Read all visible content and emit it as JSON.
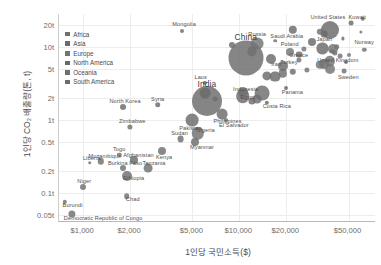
{
  "chart_data": {
    "type": "scatter",
    "title": "",
    "xlabel": "1인당 국민소득($)",
    "ylabel": "1인당 CO₂ 배출량(톤, t)",
    "xscale": "log",
    "yscale": "log",
    "xlim": [
      700,
      75000
    ],
    "ylim": [
      0.04,
      28
    ],
    "grid": true,
    "legend_position": "top-left",
    "size_encodes": "population",
    "xticks": [
      "$1,000",
      "$2,000",
      "$5,000",
      "$10,000",
      "$20,000",
      "$50,000"
    ],
    "xtick_values": [
      1000,
      2000,
      5000,
      10000,
      20000,
      50000
    ],
    "yticks": [
      "20t",
      "10t",
      "5t",
      "2t",
      "1t",
      "0.5t",
      "0.2t",
      "0.1t",
      "0.05t"
    ],
    "ytick_values": [
      20,
      10,
      5,
      2,
      1,
      0.5,
      0.2,
      0.1,
      0.05
    ],
    "legend": [
      {
        "label": "Africa",
        "color": "#6f6f6f"
      },
      {
        "label": "Asia",
        "color": "#6a6a6a"
      },
      {
        "label": "Europe",
        "color": "#737373"
      },
      {
        "label": "North America",
        "color": "#696969"
      },
      {
        "label": "Oceania",
        "color": "#707070"
      },
      {
        "label": "South America",
        "color": "#6d6d6d"
      }
    ],
    "points": [
      {
        "name": "Qatar",
        "x": 62000,
        "y": 24.0,
        "r": 2.2,
        "g": "Asia",
        "label": false
      },
      {
        "name": "Kuwait",
        "x": 52000,
        "y": 21.0,
        "r": 2.4,
        "g": "Asia",
        "label": true,
        "lx": 6,
        "ly": -6
      },
      {
        "name": "United States",
        "x": 38000,
        "y": 17.0,
        "r": 9.0,
        "g": "North America",
        "label": true,
        "lx": -2,
        "ly": -13
      },
      {
        "name": "Mongolia",
        "x": 4300,
        "y": 16.5,
        "r": 2.0,
        "g": "Asia",
        "label": true,
        "lx": 2,
        "ly": -7
      },
      {
        "name": "Australia",
        "x": 33000,
        "y": 16.0,
        "r": 3.2,
        "g": "Oceania",
        "label": false
      },
      {
        "name": "Canada",
        "x": 35000,
        "y": 15.0,
        "r": 3.4,
        "g": "North America",
        "label": false
      },
      {
        "name": "Luxembourg",
        "x": 60000,
        "y": 16.0,
        "r": 1.6,
        "g": "Europe",
        "label": false
      },
      {
        "name": "Brunei",
        "x": 46000,
        "y": 13.0,
        "r": 1.6,
        "g": "Asia",
        "label": false
      },
      {
        "name": "Estonia",
        "x": 17000,
        "y": 12.0,
        "r": 1.8,
        "g": "Europe",
        "label": false
      },
      {
        "name": "Russia",
        "x": 13000,
        "y": 11.0,
        "r": 6.4,
        "g": "Europe",
        "label": true,
        "lx": 0,
        "ly": -10
      },
      {
        "name": "Kazakhstan",
        "x": 9000,
        "y": 10.5,
        "r": 3.0,
        "g": "Asia",
        "label": false
      },
      {
        "name": "Norway",
        "x": 63000,
        "y": 9.0,
        "r": 2.2,
        "g": "Europe",
        "label": true,
        "lx": 0,
        "ly": -8
      },
      {
        "name": "Netherlands",
        "x": 42000,
        "y": 10.0,
        "r": 2.8,
        "g": "Europe",
        "label": false
      },
      {
        "name": "Japan",
        "x": 34000,
        "y": 9.5,
        "r": 5.6,
        "g": "Asia",
        "label": true,
        "lx": 2,
        "ly": -9
      },
      {
        "name": "Germany",
        "x": 40000,
        "y": 9.2,
        "r": 5.0,
        "g": "Europe",
        "label": false
      },
      {
        "name": "Poland",
        "x": 21000,
        "y": 8.5,
        "r": 4.0,
        "g": "Europe",
        "label": true,
        "lx": 0,
        "ly": -8
      },
      {
        "name": "South Korea",
        "x": 29000,
        "y": 11.5,
        "r": 4.0,
        "g": "Asia",
        "label": false
      },
      {
        "name": "Finland",
        "x": 39000,
        "y": 8.8,
        "r": 2.0,
        "g": "Europe",
        "label": false
      },
      {
        "name": "Czechia",
        "x": 26000,
        "y": 9.4,
        "r": 2.6,
        "g": "Europe",
        "label": false
      },
      {
        "name": "China",
        "x": 11000,
        "y": 7.0,
        "r": 17.5,
        "g": "Asia",
        "label": true,
        "lx": 0,
        "ly": -21,
        "big": true
      },
      {
        "name": "Belgium",
        "x": 41000,
        "y": 8.2,
        "r": 2.6,
        "g": "Europe",
        "label": false
      },
      {
        "name": "Austria",
        "x": 44000,
        "y": 7.4,
        "r": 2.4,
        "g": "Europe",
        "label": false
      },
      {
        "name": "Ireland",
        "x": 50000,
        "y": 7.6,
        "r": 2.0,
        "g": "Europe",
        "label": false
      },
      {
        "name": "Denmark",
        "x": 48000,
        "y": 6.2,
        "r": 2.0,
        "g": "Europe",
        "label": false
      },
      {
        "name": "United Kingdom",
        "x": 38000,
        "y": 6.3,
        "r": 5.2,
        "g": "Europe",
        "label": true,
        "lx": 8,
        "ly": -1
      },
      {
        "name": "Sweden",
        "x": 47000,
        "y": 4.6,
        "r": 2.4,
        "g": "Europe",
        "label": true,
        "lx": 4,
        "ly": 6
      },
      {
        "name": "Greece",
        "x": 24000,
        "y": 6.6,
        "r": 2.6,
        "g": "Europe",
        "label": true,
        "lx": 0,
        "ly": -5
      },
      {
        "name": "Saudi Arabia",
        "x": 22000,
        "y": 17.0,
        "r": 4.2,
        "g": "Asia",
        "label": true,
        "lx": -6,
        "ly": 6
      },
      {
        "name": "Iran",
        "x": 16000,
        "y": 6.8,
        "r": 5.0,
        "g": "Asia",
        "label": true,
        "lx": 5,
        "ly": 5
      },
      {
        "name": "Turkey",
        "x": 19000,
        "y": 5.4,
        "r": 5.0,
        "g": "Asia",
        "label": true,
        "lx": 6,
        "ly": -4
      },
      {
        "name": "Malaysia",
        "x": 24000,
        "y": 7.8,
        "r": 3.4,
        "g": "Asia",
        "label": false
      },
      {
        "name": "South Africa",
        "x": 12000,
        "y": 8.6,
        "r": 4.6,
        "g": "Africa",
        "label": false
      },
      {
        "name": "Spain",
        "x": 33000,
        "y": 5.6,
        "r": 4.2,
        "g": "Europe",
        "label": false
      },
      {
        "name": "Italy",
        "x": 35000,
        "y": 5.8,
        "r": 5.0,
        "g": "Europe",
        "label": false
      },
      {
        "name": "France",
        "x": 38000,
        "y": 5.0,
        "r": 5.0,
        "g": "Europe",
        "label": false
      },
      {
        "name": "Portugal",
        "x": 27000,
        "y": 4.8,
        "r": 2.6,
        "g": "Europe",
        "label": false
      },
      {
        "name": "Chile",
        "x": 22000,
        "y": 4.5,
        "r": 3.2,
        "g": "South America",
        "label": false
      },
      {
        "name": "Mexico",
        "x": 17000,
        "y": 3.9,
        "r": 5.4,
        "g": "North America",
        "label": false
      },
      {
        "name": "Argentina",
        "x": 19000,
        "y": 4.3,
        "r": 4.2,
        "g": "South America",
        "label": false
      },
      {
        "name": "Thailand",
        "x": 15000,
        "y": 4.0,
        "r": 4.6,
        "g": "Asia",
        "label": false
      },
      {
        "name": "Egypt",
        "x": 10500,
        "y": 2.4,
        "r": 5.0,
        "g": "Africa",
        "label": true,
        "lx": 5,
        "ly": 5
      },
      {
        "name": "Panama",
        "x": 20000,
        "y": 2.7,
        "r": 2.0,
        "g": "North America",
        "label": true,
        "lx": 6,
        "ly": 4
      },
      {
        "name": "Brazil",
        "x": 14000,
        "y": 2.3,
        "r": 7.4,
        "g": "South America",
        "label": false
      },
      {
        "name": "Indonesia",
        "x": 10500,
        "y": 2.1,
        "r": 6.8,
        "g": "Asia",
        "label": true,
        "lx": 3,
        "ly": -7
      },
      {
        "name": "Colombia",
        "x": 13000,
        "y": 1.9,
        "r": 4.4,
        "g": "South America",
        "label": false
      },
      {
        "name": "Costa Rica",
        "x": 15000,
        "y": 1.7,
        "r": 2.2,
        "g": "North America",
        "label": true,
        "lx": 10,
        "ly": 3
      },
      {
        "name": "Peru",
        "x": 12000,
        "y": 1.8,
        "r": 3.6,
        "g": "South America",
        "label": false
      },
      {
        "name": "Vietnam",
        "x": 6000,
        "y": 2.3,
        "r": 5.4,
        "g": "Asia",
        "label": false
      },
      {
        "name": "India",
        "x": 6200,
        "y": 1.8,
        "r": 15.0,
        "g": "Asia",
        "label": true,
        "lx": 0,
        "ly": -17,
        "big": true
      },
      {
        "name": "Philippines",
        "x": 7800,
        "y": 1.2,
        "r": 5.4,
        "g": "Asia",
        "label": true,
        "lx": 5,
        "ly": 7
      },
      {
        "name": "Bolivia",
        "x": 7000,
        "y": 1.9,
        "r": 2.4,
        "g": "South America",
        "label": false
      },
      {
        "name": "El Salvador",
        "x": 8200,
        "y": 1.0,
        "r": 2.0,
        "g": "North America",
        "label": true,
        "lx": 8,
        "ly": 5
      },
      {
        "name": "Syria",
        "x": 3000,
        "y": 1.6,
        "r": 2.8,
        "g": "Asia",
        "label": true,
        "lx": 0,
        "ly": -6
      },
      {
        "name": "Pakistan",
        "x": 5000,
        "y": 1.0,
        "r": 6.4,
        "g": "Asia",
        "label": true,
        "lx": -2,
        "ly": 8
      },
      {
        "name": "Nigeria",
        "x": 5400,
        "y": 0.65,
        "r": 6.2,
        "g": "Africa",
        "label": true,
        "lx": 8,
        "ly": -3
      },
      {
        "name": "North Korea",
        "x": 1800,
        "y": 1.5,
        "r": 3.0,
        "g": "Asia",
        "label": true,
        "lx": 2,
        "ly": -6
      },
      {
        "name": "Myanmar",
        "x": 5200,
        "y": 0.5,
        "r": 4.0,
        "g": "Asia",
        "label": true,
        "lx": 7,
        "ly": 5
      },
      {
        "name": "Zimbabwe",
        "x": 2000,
        "y": 0.8,
        "r": 2.6,
        "g": "Africa",
        "label": true,
        "lx": 2,
        "ly": -6
      },
      {
        "name": "Sudan",
        "x": 4200,
        "y": 0.55,
        "r": 3.4,
        "g": "Africa",
        "label": true,
        "lx": -1,
        "ly": -6
      },
      {
        "name": "Kenya",
        "x": 3200,
        "y": 0.38,
        "r": 4.0,
        "g": "Africa",
        "label": true,
        "lx": 2,
        "ly": 6
      },
      {
        "name": "Laos",
        "x": 6000,
        "y": 3.2,
        "r": 2.2,
        "g": "Asia",
        "label": true,
        "lx": -4,
        "ly": -6
      },
      {
        "name": "Togo",
        "x": 1700,
        "y": 0.33,
        "r": 2.2,
        "g": "Africa",
        "label": true,
        "lx": 0,
        "ly": -6
      },
      {
        "name": "Liberia",
        "x": 1100,
        "y": 0.26,
        "r": 1.8,
        "g": "Africa",
        "label": true,
        "lx": 2,
        "ly": -5
      },
      {
        "name": "Mozambique",
        "x": 1300,
        "y": 0.27,
        "r": 3.2,
        "g": "Africa",
        "label": true,
        "lx": 4,
        "ly": -5
      },
      {
        "name": "Afghanistan",
        "x": 2100,
        "y": 0.28,
        "r": 4.0,
        "g": "Asia",
        "label": true,
        "lx": 5,
        "ly": -5
      },
      {
        "name": "Burkina Faso",
        "x": 1800,
        "y": 0.22,
        "r": 3.0,
        "g": "Africa",
        "label": true,
        "lx": 2,
        "ly": -5
      },
      {
        "name": "Tanzania",
        "x": 2600,
        "y": 0.22,
        "r": 4.4,
        "g": "Africa",
        "label": true,
        "lx": 6,
        "ly": -5
      },
      {
        "name": "Ethiopia",
        "x": 1900,
        "y": 0.17,
        "r": 5.0,
        "g": "Africa",
        "label": true,
        "lx": 7,
        "ly": 2
      },
      {
        "name": "Niger",
        "x": 1000,
        "y": 0.12,
        "r": 3.0,
        "g": "Africa",
        "label": true,
        "lx": 1,
        "ly": -6
      },
      {
        "name": "Chad",
        "x": 1900,
        "y": 0.09,
        "r": 2.8,
        "g": "Africa",
        "label": true,
        "lx": 6,
        "ly": 3
      },
      {
        "name": "Burundi",
        "x": 760,
        "y": 0.075,
        "r": 2.2,
        "g": "Africa",
        "label": true,
        "lx": 8,
        "ly": 3
      },
      {
        "name": "Democratic Republic of Congo",
        "x": 850,
        "y": 0.052,
        "r": 3.6,
        "g": "Africa",
        "label": true,
        "lx": 31,
        "ly": 4
      }
    ]
  }
}
